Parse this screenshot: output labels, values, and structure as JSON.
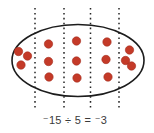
{
  "figure": {
    "background": "#ffffff",
    "ellipse": {
      "cx": 78,
      "cy": 60.5,
      "rx": 66,
      "ry": 36,
      "stroke": "#1c1c1c",
      "stroke_width": 1.6
    },
    "divider_lines": {
      "xs": [
        35,
        64,
        90.5,
        119
      ],
      "y1": 8,
      "y2": 111,
      "color": "#252525",
      "width": 1.5,
      "dash": "1.6 3.3"
    },
    "dot_color": "#c43a28",
    "dot_stroke": "#a52e1f",
    "dot_radius": 4.2,
    "groups_count": 5,
    "dots_per_group": 3,
    "total_dots": 15,
    "groups": [
      {
        "name": "group-1",
        "dots": [
          [
            18.5,
            51.5
          ],
          [
            27.5,
            56
          ],
          [
            21,
            65
          ]
        ]
      },
      {
        "name": "group-2",
        "dots": [
          [
            48.5,
            44
          ],
          [
            48.5,
            61.5
          ],
          [
            49,
            77
          ]
        ]
      },
      {
        "name": "group-3",
        "dots": [
          [
            76.5,
            41
          ],
          [
            76.5,
            61
          ],
          [
            77,
            78
          ]
        ]
      },
      {
        "name": "group-4",
        "dots": [
          [
            107,
            42
          ],
          [
            106,
            59.5
          ],
          [
            108,
            77
          ]
        ]
      },
      {
        "name": "group-5",
        "dots": [
          [
            129.5,
            50
          ],
          [
            125.5,
            60.5
          ],
          [
            131.5,
            66
          ]
        ]
      }
    ]
  },
  "caption": {
    "text": "⁻15 ÷ 5 = ⁻3",
    "color": "#3a3a3a"
  }
}
